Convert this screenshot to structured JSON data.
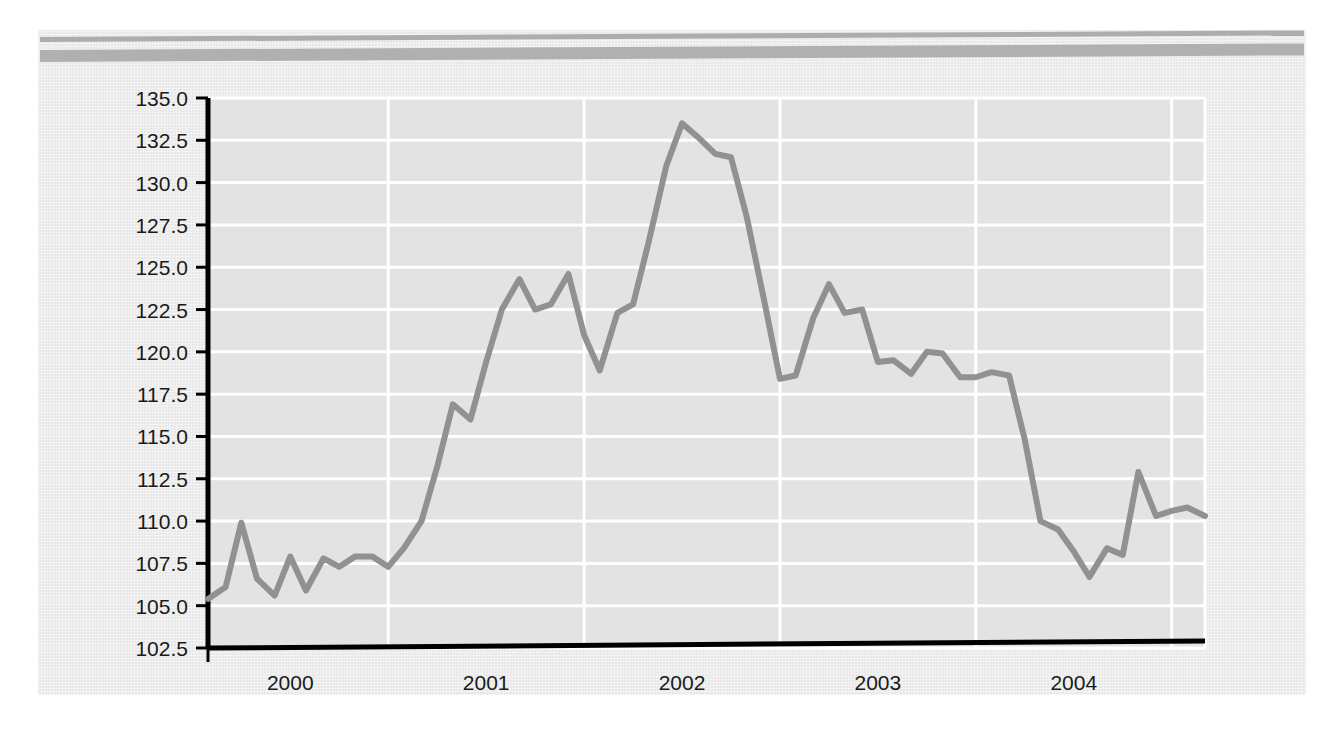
{
  "document": {
    "panel_background": "#e8e8e8",
    "rule_color": "#b0b0b0"
  },
  "chart_data": {
    "type": "line",
    "title": "",
    "subtitle": "",
    "xlabel": "",
    "ylabel": "",
    "grid": true,
    "legend": "none",
    "line_color": "#919191",
    "plot_background": "#e3e3e3",
    "gridline_color": "#ffffff",
    "axis_color": "#000000",
    "ylim": [
      102.5,
      135.0
    ],
    "ytick_step": 2.5,
    "ytick_labels": [
      "135.0",
      "132.5",
      "130.0",
      "127.5",
      "125.0",
      "122.5",
      "120.0",
      "117.5",
      "115.0",
      "112.5",
      "110.0",
      "107.5",
      "105.0",
      "102.5"
    ],
    "ytick_values": [
      135.0,
      132.5,
      130.0,
      127.5,
      125.0,
      122.5,
      120.0,
      117.5,
      115.0,
      112.5,
      110.0,
      107.5,
      105.0,
      102.5
    ],
    "xtick_labels": [
      "2000",
      "2001",
      "2002",
      "2003",
      "2004"
    ],
    "xtick_values": [
      2000.0,
      2001.0,
      2002.0,
      2003.0,
      2004.0
    ],
    "xlim": [
      1999.58,
      2004.67
    ],
    "x": [
      1999.58,
      1999.67,
      1999.75,
      1999.83,
      1999.92,
      2000.0,
      2000.08,
      2000.17,
      2000.25,
      2000.33,
      2000.42,
      2000.5,
      2000.58,
      2000.67,
      2000.75,
      2000.83,
      2000.92,
      2001.0,
      2001.08,
      2001.17,
      2001.25,
      2001.33,
      2001.42,
      2001.5,
      2001.58,
      2001.67,
      2001.75,
      2001.83,
      2001.92,
      2002.0,
      2002.08,
      2002.17,
      2002.25,
      2002.33,
      2002.42,
      2002.5,
      2002.58,
      2002.67,
      2002.75,
      2002.83,
      2002.92,
      2003.0,
      2003.08,
      2003.17,
      2003.25,
      2003.33,
      2003.42,
      2003.5,
      2003.58,
      2003.67,
      2003.75,
      2003.83,
      2003.92,
      2004.0,
      2004.08,
      2004.17,
      2004.25,
      2004.33,
      2004.42,
      2004.5,
      2004.58,
      2004.67
    ],
    "y": [
      105.4,
      106.1,
      109.9,
      106.6,
      105.6,
      107.9,
      105.9,
      107.8,
      107.3,
      107.9,
      107.9,
      107.3,
      108.4,
      110.0,
      113.2,
      116.9,
      116.0,
      119.4,
      122.5,
      124.3,
      122.5,
      122.8,
      124.6,
      121.0,
      118.9,
      122.3,
      122.8,
      126.5,
      131.0,
      133.5,
      132.7,
      131.7,
      131.5,
      128.0,
      123.0,
      118.4,
      118.6,
      122.0,
      124.0,
      122.3,
      122.5,
      119.4,
      119.5,
      118.7,
      120.0,
      119.9,
      118.5,
      118.5,
      118.8,
      118.6,
      114.8,
      110.0,
      109.5,
      108.2,
      106.7,
      108.4,
      108.0,
      112.9,
      110.3,
      110.6,
      110.8,
      110.3,
      107.5,
      104.7
    ]
  }
}
